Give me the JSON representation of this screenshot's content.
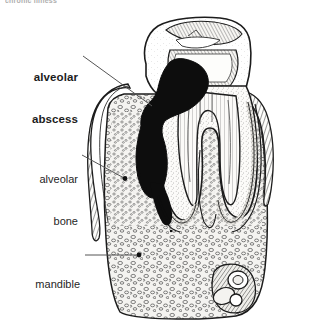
{
  "figure": {
    "kind": "anatomical-line-illustration",
    "width": 311,
    "height": 328,
    "background_color": "#ffffff",
    "ink_color": "#1c1c1c",
    "cut_header_text": "chronic illness",
    "labels": [
      {
        "id": "alveolar-abscess",
        "line1": "alveolar",
        "line2": "abscess",
        "bold": true,
        "leader": "diagonal"
      },
      {
        "id": "alveolar-bone",
        "line1": "alveolar",
        "line2": "bone",
        "bold": false,
        "leader": "diagonal-dot"
      },
      {
        "id": "mandible",
        "line1": "mandible",
        "line2": "",
        "bold": false,
        "leader": "horizontal-dot"
      }
    ]
  },
  "colors": {
    "ink": "#1c1c1c",
    "leader": "#555555",
    "abscess_fill": "#0d0d0d",
    "bone_fill": "#f2f1ee",
    "pulp_fill": "#ffffff",
    "gingiva_fill": "#fbfbf9"
  }
}
